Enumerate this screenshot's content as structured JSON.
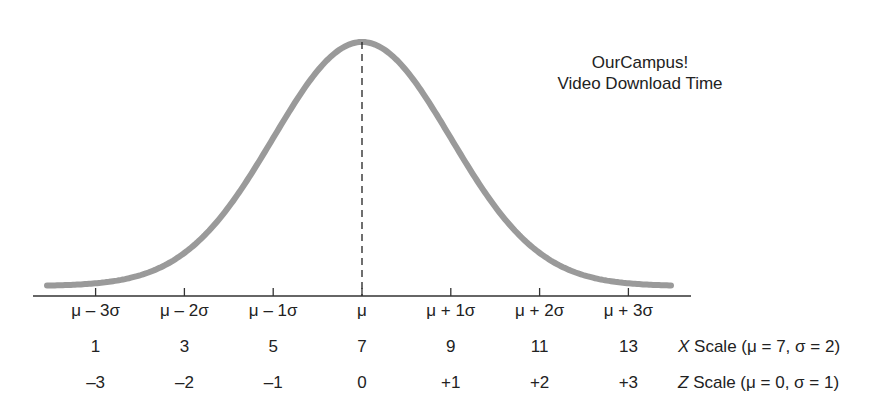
{
  "chart_data": {
    "type": "line",
    "title": "OurCampus! Video Download Time",
    "title_lines": [
      "OurCampus!",
      "Video Download Time"
    ],
    "sigma_labels": [
      "μ – 3σ",
      "μ – 2σ",
      "μ – 1σ",
      "μ",
      "μ + 1σ",
      "μ + 2σ",
      "μ + 3σ"
    ],
    "x_scale": {
      "values": [
        1,
        3,
        5,
        7,
        9,
        11,
        13
      ],
      "labels": [
        "1",
        "3",
        "5",
        "7",
        "9",
        "11",
        "13"
      ],
      "name": "X",
      "caption": "Scale (μ = 7, σ = 2)",
      "mean": 7,
      "sd": 2
    },
    "z_scale": {
      "values": [
        -3,
        -2,
        -1,
        0,
        1,
        2,
        3
      ],
      "labels": [
        "–3",
        "–2",
        "–1",
        "0",
        "+1",
        "+2",
        "+3"
      ],
      "name": "Z",
      "caption": "Scale (μ = 0, σ = 1)",
      "mean": 0,
      "sd": 1
    },
    "curve": {
      "distribution": "normal",
      "mean": 7,
      "sd": 2,
      "color": "#999999"
    },
    "mean_line": {
      "style": "dashed",
      "x": 7
    },
    "grid": false,
    "legend": null
  }
}
